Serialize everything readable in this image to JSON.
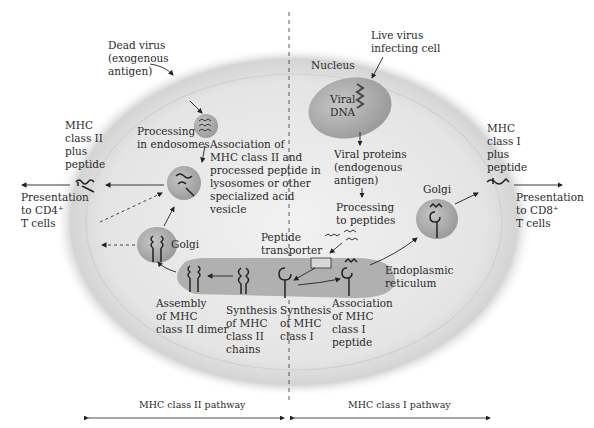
{
  "diagram": {
    "colors": {
      "cell_fill": "#e6e6e6",
      "cell_shadow": "#bdbdbd",
      "organelle_fill": "#a9a9a9",
      "er_fill": "#b3b3b3",
      "line": "#222222"
    },
    "left": {
      "dead_virus": "Dead virus\n(exogenous\nantigen)",
      "processing_endosomes": "Processing\nin endosomes",
      "association_mhc2": "Association of\nMHC class II and\nprocessed peptide in\nlysosomes or other\nspecialized acid\nvesicle",
      "mhc2_plus_peptide": "MHC\nclass II\nplus\npeptide",
      "presentation_cd4": "Presentation\nto CD4⁺\nT cells",
      "golgi": "Golgi",
      "assembly_mhc2": "Assembly\nof MHC\nclass II dimer",
      "synthesis_mhc2": "Synthesis\nof MHC\nclass II\nchains"
    },
    "right": {
      "live_virus": "Live virus\ninfecting cell",
      "nucleus": "Nucleus",
      "viral_dna": "Viral\nDNA",
      "viral_proteins": "Viral proteins\n(endogenous\nantigen)",
      "processing_peptides": "Processing\nto peptides",
      "peptide_transporter": "Peptide\ntransporter",
      "golgi": "Golgi",
      "mhc1_plus_peptide": "MHC\nclass I\nplus\npeptide",
      "presentation_cd8": "Presentation\nto CD8⁺\nT cells",
      "endoplasmic_reticulum": "Endoplasmic\nreticulum",
      "synthesis_mhc1": "Synthesis\nof MHC\nclass I",
      "association_mhc1": "Association\nof MHC\nclass I\npeptide"
    },
    "footer": {
      "mhc2_pathway": "MHC class II pathway",
      "mhc1_pathway": "MHC class I pathway"
    }
  }
}
